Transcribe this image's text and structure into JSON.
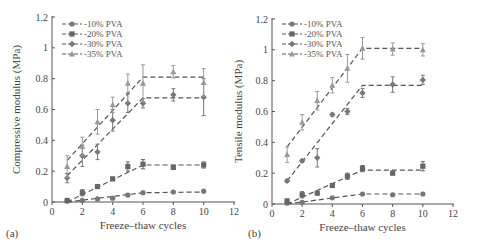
{
  "figure": {
    "panels": [
      "(a)",
      "(b)"
    ]
  },
  "chart_data": [
    {
      "type": "line",
      "panel": "(a)",
      "title": "",
      "xlabel": "Freeze–thaw cycles",
      "ylabel": "Compressive modulus (MPa)",
      "xlim": [
        0,
        12
      ],
      "ylim": [
        0,
        1.2
      ],
      "xticks": [
        0,
        2,
        4,
        6,
        8,
        10,
        12
      ],
      "yticks": [
        0,
        0.2,
        0.4,
        0.6,
        0.8,
        1,
        1.2
      ],
      "grid": false,
      "legend_position": "top-left",
      "series": [
        {
          "name": "10% PVA",
          "marker": "circle",
          "x": [
            1,
            2,
            3,
            4,
            5,
            6,
            8,
            10
          ],
          "values": [
            0.005,
            0.01,
            0.02,
            0.025,
            0.045,
            0.06,
            0.065,
            0.07
          ],
          "err": [
            0.005,
            0.005,
            0.005,
            0.01,
            0.01,
            0.01,
            0.005,
            0.005
          ],
          "fit": [
            [
              1,
              0.0
            ],
            [
              6,
              0.06
            ],
            [
              10,
              0.065
            ]
          ]
        },
        {
          "name": "20% PVA",
          "marker": "square",
          "x": [
            1,
            2,
            3,
            4,
            5,
            6,
            8,
            10
          ],
          "values": [
            0.01,
            0.06,
            0.1,
            0.15,
            0.23,
            0.245,
            0.225,
            0.24
          ],
          "err": [
            0.01,
            0.02,
            0.01,
            0.01,
            0.03,
            0.03,
            0.01,
            0.02
          ],
          "fit": [
            [
              1,
              0.0
            ],
            [
              6,
              0.24
            ],
            [
              10,
              0.24
            ]
          ]
        },
        {
          "name": "30% PVA",
          "marker": "diamond",
          "x": [
            1,
            2,
            3,
            4,
            5,
            6,
            8,
            10
          ],
          "values": [
            0.155,
            0.3,
            0.325,
            0.53,
            0.64,
            0.64,
            0.695,
            0.68
          ],
          "err": [
            0.03,
            0.07,
            0.05,
            0.07,
            0.06,
            0.03,
            0.04,
            0.12
          ],
          "fit": [
            [
              1,
              0.17
            ],
            [
              6,
              0.675
            ],
            [
              10,
              0.675
            ]
          ]
        },
        {
          "name": "35% PVA",
          "marker": "triangle",
          "x": [
            1,
            2,
            3,
            4,
            5,
            6,
            8,
            10
          ],
          "values": [
            0.23,
            0.36,
            0.52,
            0.63,
            0.77,
            0.77,
            0.845,
            0.775
          ],
          "err": [
            0.07,
            0.06,
            0.08,
            0.05,
            0.06,
            0.12,
            0.04,
            0.09
          ],
          "fit": [
            [
              1,
              0.27
            ],
            [
              6,
              0.81
            ],
            [
              10,
              0.81
            ]
          ]
        }
      ]
    },
    {
      "type": "line",
      "panel": "(b)",
      "title": "",
      "xlabel": "Freeze–thaw cycles",
      "ylabel": "Tensile modulus (MPa)",
      "xlim": [
        0,
        12
      ],
      "ylim": [
        0,
        1.2
      ],
      "xticks": [
        0,
        2,
        4,
        6,
        8,
        10,
        12
      ],
      "yticks": [
        0,
        0.2,
        0.4,
        0.6,
        0.8,
        1,
        1.2
      ],
      "grid": false,
      "legend_position": "top-left",
      "series": [
        {
          "name": "10% PVA",
          "marker": "circle",
          "x": [
            1,
            2,
            4,
            6,
            8,
            10
          ],
          "values": [
            0.005,
            0.01,
            0.04,
            0.065,
            0.06,
            0.065
          ],
          "err": [
            0.005,
            0.005,
            0.005,
            0.005,
            0.005,
            0.01
          ],
          "fit": [
            [
              1,
              0.0
            ],
            [
              6,
              0.065
            ],
            [
              10,
              0.065
            ]
          ]
        },
        {
          "name": "20% PVA",
          "marker": "square",
          "x": [
            1,
            2,
            3,
            4,
            5,
            6,
            8,
            10
          ],
          "values": [
            0.02,
            0.06,
            0.07,
            0.12,
            0.18,
            0.23,
            0.2,
            0.245
          ],
          "err": [
            0.01,
            0.02,
            0.01,
            0.01,
            0.02,
            0.02,
            0.01,
            0.03
          ],
          "fit": [
            [
              1,
              0.0
            ],
            [
              6,
              0.22
            ],
            [
              10,
              0.22
            ]
          ]
        },
        {
          "name": "30% PVA",
          "marker": "diamond",
          "x": [
            1,
            2,
            3,
            4,
            5,
            6,
            8,
            10
          ],
          "values": [
            0.15,
            0.28,
            0.3,
            0.58,
            0.6,
            0.72,
            0.775,
            0.805
          ],
          "err": [
            0.01,
            0.01,
            0.06,
            0.01,
            0.02,
            0.03,
            0.05,
            0.03
          ],
          "fit": [
            [
              1,
              0.15
            ],
            [
              6,
              0.77
            ],
            [
              10,
              0.77
            ]
          ]
        },
        {
          "name": "35% PVA",
          "marker": "triangle",
          "x": [
            1,
            2,
            3,
            4,
            5,
            6,
            8,
            10
          ],
          "values": [
            0.32,
            0.53,
            0.67,
            0.77,
            0.88,
            1.01,
            1.005,
            1.0
          ],
          "err": [
            0.05,
            0.05,
            0.06,
            0.05,
            0.09,
            0.07,
            0.04,
            0.04
          ],
          "fit": [
            [
              1,
              0.37
            ],
            [
              6,
              1.01
            ],
            [
              10,
              1.01
            ]
          ]
        }
      ]
    }
  ],
  "colors": {
    "axis": "#555555",
    "series": [
      "#777777",
      "#666666",
      "#777777",
      "#999999"
    ],
    "fit_line": "#555555"
  }
}
